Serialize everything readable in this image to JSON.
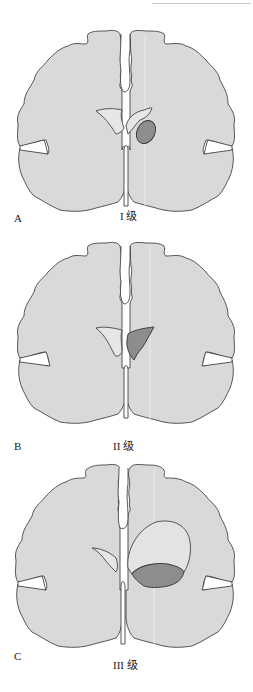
{
  "figure": {
    "panels": [
      {
        "letter": "A",
        "grade_label": "I 级"
      },
      {
        "letter": "B",
        "grade_label": "II 级"
      },
      {
        "letter": "C",
        "grade_label": "III 级"
      }
    ]
  },
  "colors": {
    "brain_fill": "#d9d9d9",
    "outline": "#444444",
    "ventricle_fill": "#e6e6e6",
    "hemorrhage_fill": "#8d8d8d",
    "background": "#ffffff"
  }
}
